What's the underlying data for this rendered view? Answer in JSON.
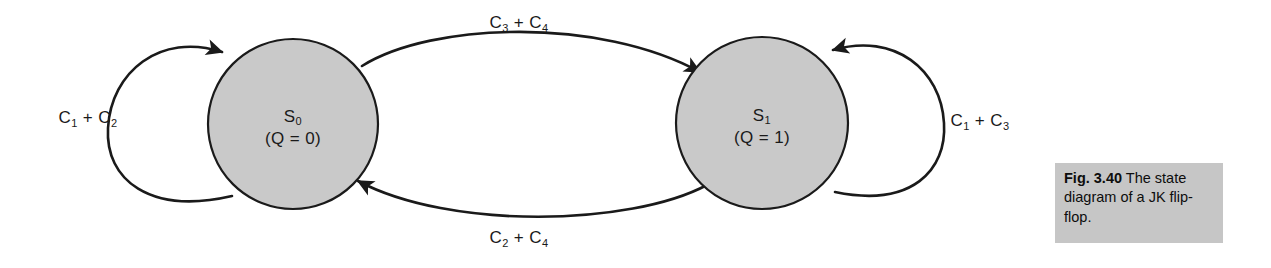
{
  "figure": {
    "type": "state-transition-diagram",
    "background_color": "#ffffff",
    "ink_color": "#1a1a1a",
    "state_fill_color": "#c9c9c9",
    "caption_fill_color": "#c6c6c6"
  },
  "states": [
    {
      "id": "S0",
      "name": "S",
      "subscript": "0",
      "condition": "(Q = 0)",
      "cx": 293,
      "cy": 124,
      "r": 85
    },
    {
      "id": "S1",
      "name": "S",
      "subscript": "1",
      "condition": "(Q = 1)",
      "cx": 762,
      "cy": 123,
      "r": 86
    }
  ],
  "transitions": [
    {
      "id": "self-loop-s0",
      "from": "S0",
      "to": "S0",
      "label_prefix": "C",
      "label_sub1": "1",
      "label_mid": " + C",
      "label_sub2": "2",
      "label_text": "C1 + C2",
      "label_x": 88,
      "label_y": 123
    },
    {
      "id": "s0-to-s1",
      "from": "S0",
      "to": "S1",
      "label_prefix": "C",
      "label_sub1": "3",
      "label_mid": " + C",
      "label_sub2": "4",
      "label_text": "C3 + C4",
      "label_x": 519,
      "label_y": 28
    },
    {
      "id": "s1-to-s0",
      "from": "S1",
      "to": "S0",
      "label_prefix": "C",
      "label_sub1": "2",
      "label_mid": " + C",
      "label_sub2": "4",
      "label_text": "C2 + C4",
      "label_x": 519,
      "label_y": 243
    },
    {
      "id": "self-loop-s1",
      "from": "S1",
      "to": "S1",
      "label_prefix": "C",
      "label_sub1": "1",
      "label_mid": " + C",
      "label_sub2": "3",
      "label_text": "C1 + C3",
      "label_x": 980,
      "label_y": 126
    }
  ],
  "caption": {
    "figure_number": "Fig. 3.40",
    "text": " The state diagram of a JK flip-flop."
  }
}
